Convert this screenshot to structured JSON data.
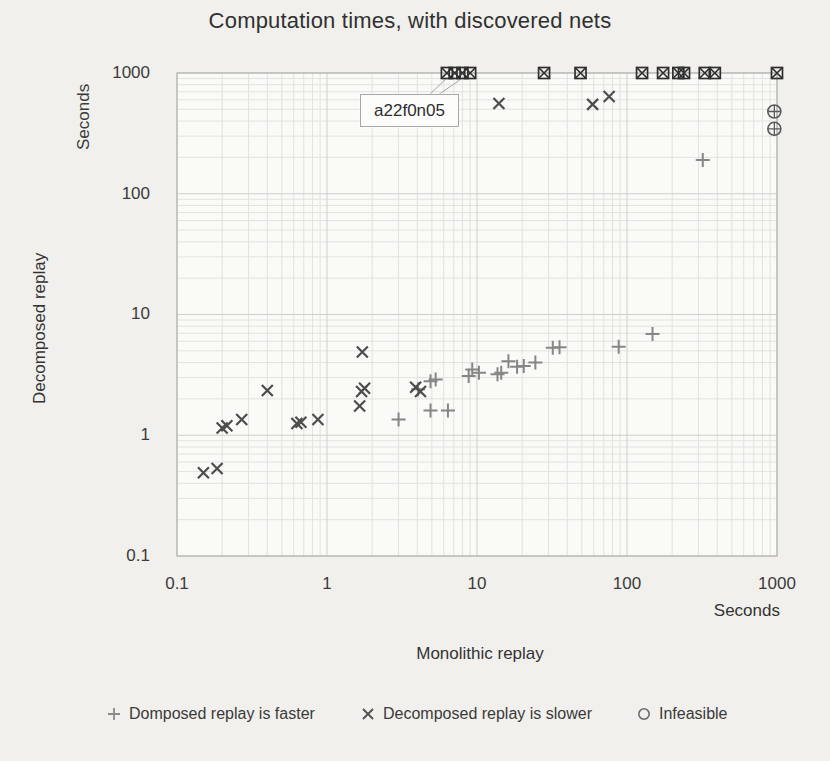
{
  "chart_data": {
    "type": "scatter",
    "title": "Computation times, with discovered nets",
    "xlabel": "Monolithic replay",
    "ylabel": "Decomposed replay",
    "x_unit": "Seconds",
    "y_unit": "Seconds",
    "scale": "log-log",
    "xlim": [
      0.1,
      1000
    ],
    "ylim": [
      0.1,
      1000
    ],
    "x_ticks": [
      "0.1",
      "1",
      "10",
      "100",
      "1000"
    ],
    "y_ticks": [
      "1000",
      "100",
      "10",
      "1",
      "0.1"
    ],
    "grid": "on",
    "legend_position": "bottom",
    "annotation": {
      "text": "a22f0n05",
      "targets": [
        [
          6.3,
          1000
        ],
        [
          7.8,
          1000
        ]
      ]
    },
    "colors": {
      "plus": "#868686",
      "cross": "#4d4d4d",
      "circle": "#5a5a5a",
      "boxed": "#2f2f2f",
      "grid_minor": "#e3e2df",
      "grid_major": "#cfcecb",
      "frame": "#b5b4b1",
      "plot_bg": "#fafaf7",
      "leader": "#a3a2a0"
    },
    "series": [
      {
        "name": "Domposed replay is faster",
        "marker": "plus",
        "points": [
          [
            3.0,
            1.35
          ],
          [
            4.05,
            2.4
          ],
          [
            4.9,
            2.8
          ],
          [
            5.3,
            2.9
          ],
          [
            4.9,
            1.6
          ],
          [
            6.4,
            1.6
          ],
          [
            8.8,
            3.1
          ],
          [
            9.3,
            3.5
          ],
          [
            10.3,
            3.3
          ],
          [
            13.7,
            3.2
          ],
          [
            14.5,
            3.3
          ],
          [
            16.2,
            4.1
          ],
          [
            18.5,
            3.7
          ],
          [
            20.5,
            3.75
          ],
          [
            24.5,
            4.0
          ],
          [
            32,
            5.3
          ],
          [
            35.5,
            5.35
          ],
          [
            88,
            5.4
          ],
          [
            148,
            6.9
          ],
          [
            320,
            190
          ]
        ]
      },
      {
        "name": "Decomposed replay is slower",
        "marker": "cross",
        "points": [
          [
            0.15,
            0.49
          ],
          [
            0.185,
            0.53
          ],
          [
            0.2,
            1.15
          ],
          [
            0.215,
            1.2
          ],
          [
            0.27,
            1.35
          ],
          [
            0.4,
            2.35
          ],
          [
            0.63,
            1.25
          ],
          [
            0.67,
            1.28
          ],
          [
            0.87,
            1.35
          ],
          [
            1.65,
            1.75
          ],
          [
            1.7,
            2.3
          ],
          [
            1.78,
            2.45
          ],
          [
            1.72,
            4.9
          ],
          [
            3.9,
            2.5
          ],
          [
            4.2,
            2.3
          ],
          [
            14,
            560
          ],
          [
            59,
            550
          ],
          [
            76,
            640
          ]
        ]
      },
      {
        "name": "Infeasible",
        "marker": "circle-plus",
        "points": [
          [
            960,
            480
          ],
          [
            960,
            345
          ]
        ]
      },
      {
        "name": "timeout-boxed-points",
        "marker": "boxed-cross",
        "in_legend": false,
        "points": [
          [
            6.3,
            1000
          ],
          [
            7.1,
            1000
          ],
          [
            8.0,
            1000
          ],
          [
            9.0,
            1000
          ],
          [
            28,
            1000
          ],
          [
            49,
            1000
          ],
          [
            126,
            1000
          ],
          [
            174,
            1000
          ],
          [
            220,
            1000
          ],
          [
            240,
            1000
          ],
          [
            330,
            1000
          ],
          [
            385,
            1000
          ],
          [
            1000,
            1000
          ]
        ]
      }
    ]
  }
}
